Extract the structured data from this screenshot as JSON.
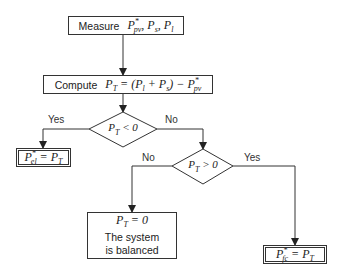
{
  "nodes": {
    "measure": {
      "verb": "Measure",
      "expr": "P*pv, Ps, Pl"
    },
    "compute": {
      "verb": "Compute",
      "expr_lhs": "PT",
      "expr_rhs": "= (Pl + Ps) − P*pv"
    },
    "decision1": {
      "condition": "PT < 0"
    },
    "decision2": {
      "condition": "PT > 0"
    },
    "el_assign": {
      "expr": "P*el = PT"
    },
    "balanced": {
      "expr": "PT = 0",
      "line1": "The system",
      "line2": "is balanced"
    },
    "fc_assign": {
      "expr": "P*fc = PT"
    }
  },
  "edges": {
    "d1_yes": "Yes",
    "d1_no": "No",
    "d2_no": "No",
    "d2_yes": "Yes"
  },
  "colors": {
    "stroke": "#333333",
    "background": "#ffffff"
  }
}
